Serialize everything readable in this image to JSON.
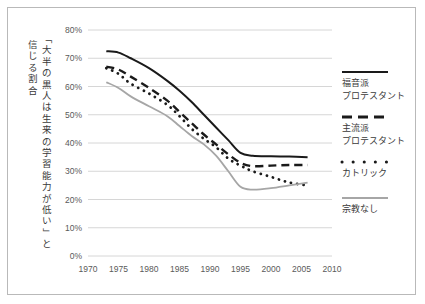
{
  "chart_data": {
    "type": "line",
    "title": "",
    "subtitle": "",
    "xlabel": "",
    "ylabel": "「大半の黒人は生来の学習能力が低い」と信じる割合",
    "ylabel_columns": [
      "「大半の黒人は生来の学習能力が低い」と",
      "信じる割合"
    ],
    "xlim": [
      1970,
      2010
    ],
    "ylim": [
      0,
      80
    ],
    "x_ticks": [
      1970,
      1975,
      1980,
      1985,
      1990,
      1995,
      2000,
      2005,
      2010
    ],
    "x_tick_labels": [
      "1970",
      "1975",
      "1980",
      "1985",
      "1990",
      "1995",
      "2000",
      "2005",
      "2010"
    ],
    "y_ticks": [
      0,
      10,
      20,
      30,
      40,
      50,
      60,
      70,
      80
    ],
    "y_tick_labels": [
      "0%",
      "10%",
      "20%",
      "30%",
      "40%",
      "50%",
      "60%",
      "70%",
      "80%"
    ],
    "grid": "horizontal",
    "legend_position": "right",
    "series": [
      {
        "name": "福音派プロテスタント",
        "style": "solid",
        "color": "#1a1a1a",
        "x": [
          1973,
          1975,
          1977,
          1980,
          1983,
          1985,
          1987,
          1989,
          1991,
          1993,
          1995,
          1997,
          2000,
          2003,
          2006
        ],
        "values": [
          72.5,
          72.0,
          70.0,
          66.5,
          62.0,
          58.5,
          54.5,
          50.0,
          45.5,
          41.0,
          36.5,
          35.5,
          35.3,
          35.2,
          35.0
        ]
      },
      {
        "name": "主流派プロテスタント",
        "style": "dashed",
        "color": "#1a1a1a",
        "x": [
          1973,
          1975,
          1977,
          1980,
          1983,
          1985,
          1987,
          1989,
          1991,
          1993,
          1995,
          1997,
          2000,
          2003,
          2006
        ],
        "values": [
          67.0,
          66.0,
          63.5,
          59.5,
          55.0,
          51.0,
          47.0,
          43.0,
          39.5,
          36.0,
          33.0,
          31.8,
          32.0,
          32.2,
          32.2
        ]
      },
      {
        "name": "カトリック",
        "style": "dotted",
        "color": "#1a1a1a",
        "x": [
          1973,
          1975,
          1977,
          1980,
          1983,
          1985,
          1987,
          1989,
          1991,
          1993,
          1995,
          1997,
          2000,
          2003,
          2006
        ],
        "values": [
          66.5,
          64.5,
          61.0,
          57.5,
          53.5,
          49.5,
          45.0,
          41.5,
          38.5,
          34.5,
          32.0,
          30.0,
          28.0,
          26.0,
          25.0
        ]
      },
      {
        "name": "宗教なし",
        "style": "solid-gray",
        "color": "#a6a6a6",
        "x": [
          1973,
          1975,
          1977,
          1980,
          1983,
          1985,
          1987,
          1989,
          1991,
          1993,
          1995,
          1997,
          2000,
          2003,
          2006
        ],
        "values": [
          61.5,
          59.5,
          56.5,
          53.0,
          49.5,
          46.0,
          42.5,
          39.5,
          35.5,
          30.0,
          24.5,
          23.5,
          24.0,
          25.0,
          26.0
        ]
      }
    ]
  },
  "legend": {
    "items": [
      {
        "label_line1": "福音派",
        "label_line2": "プロテスタント",
        "style": "solid",
        "color": "#1a1a1a"
      },
      {
        "label_line1": "主流派",
        "label_line2": "プロテスタント",
        "style": "dashed",
        "color": "#1a1a1a"
      },
      {
        "label_line1": "カトリック",
        "label_line2": "",
        "style": "dotted",
        "color": "#1a1a1a"
      },
      {
        "label_line1": "宗教なし",
        "label_line2": "",
        "style": "solid-gray",
        "color": "#a6a6a6"
      }
    ]
  },
  "colors": {
    "frame_border": "#b9b9b9",
    "gridline": "#d6d6d6",
    "axis_text": "#5a5a5a",
    "label_text": "#3a3a3a",
    "line_dark": "#1a1a1a",
    "line_gray": "#a6a6a6",
    "background": "#ffffff"
  }
}
